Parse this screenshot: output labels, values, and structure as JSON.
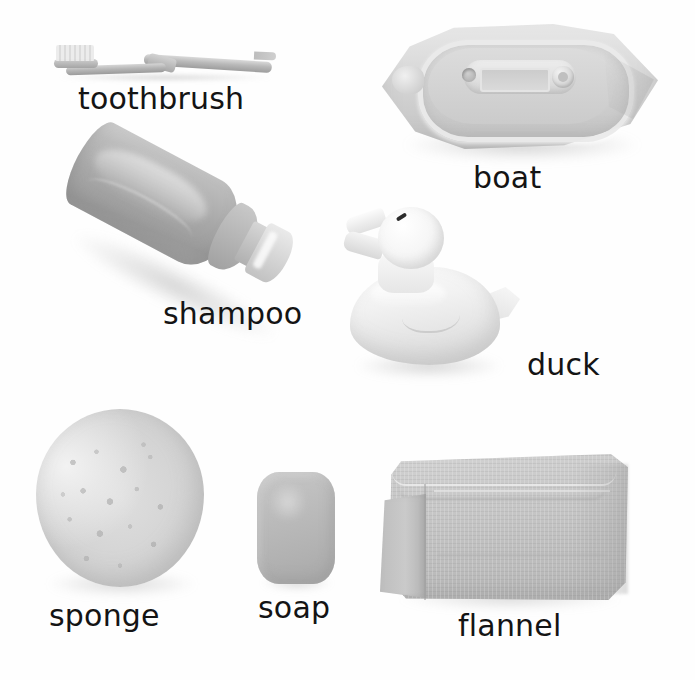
{
  "page": {
    "background_color": "#fefefe",
    "text_color": "#141414",
    "width": 695,
    "height": 680
  },
  "items": [
    {
      "id": "toothbrush",
      "label": "toothbrush",
      "icon": "toothbrush-icon",
      "label_position": {
        "left": 78,
        "top": 84
      },
      "label_font_size": 30,
      "color": "#b4b4b4"
    },
    {
      "id": "boat",
      "label": "boat",
      "icon": "boat-icon",
      "label_position": {
        "left": 473,
        "top": 163
      },
      "label_font_size": 30,
      "color": "#dcdcdc"
    },
    {
      "id": "shampoo",
      "label": "shampoo",
      "icon": "shampoo-bottle-icon",
      "label_position": {
        "left": 163,
        "top": 299
      },
      "label_font_size": 30,
      "color": "#a8a8a8"
    },
    {
      "id": "duck",
      "label": "duck",
      "icon": "rubber-duck-icon",
      "label_position": {
        "left": 527,
        "top": 350
      },
      "label_font_size": 30,
      "color": "#f2f2f2"
    },
    {
      "id": "sponge",
      "label": "sponge",
      "icon": "sponge-icon",
      "label_position": {
        "left": 49,
        "top": 601
      },
      "label_font_size": 30,
      "color": "#d2d2d2"
    },
    {
      "id": "soap",
      "label": "soap",
      "icon": "soap-bar-icon",
      "label_position": {
        "left": 258,
        "top": 593
      },
      "label_font_size": 30,
      "color": "#b8b8b8"
    },
    {
      "id": "flannel",
      "label": "flannel",
      "icon": "flannel-towel-icon",
      "label_position": {
        "left": 458,
        "top": 611
      },
      "label_font_size": 30,
      "color": "#c6c6c6"
    }
  ]
}
